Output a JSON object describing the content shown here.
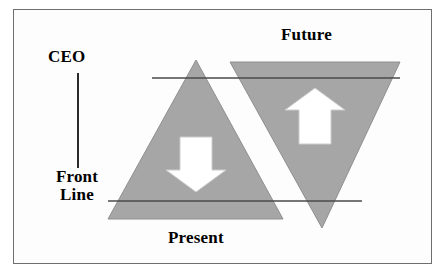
{
  "diagram": {
    "colors": {
      "triangle_fill": "#a6a6a6",
      "triangle_stroke": "#8f8f8f",
      "rule_line": "#4a4a4a",
      "arrow_fill": "#ffffff",
      "arrow_stroke": "#cccccc",
      "frame_border": "#6e6e6e",
      "text": "#000000",
      "background": "#ffffff"
    },
    "labels": {
      "ceo": "CEO",
      "front_line_1": "Front",
      "front_line_2": "Line",
      "future": "Future",
      "present": "Present"
    },
    "shapes": {
      "present_triangle": {
        "name": "upward-triangle",
        "points": "196,60 283,219 108,219"
      },
      "future_triangle": {
        "name": "downward-triangle",
        "points": "230,62 400,62 322,228"
      },
      "upper_rule": {
        "x1": 152,
        "y1": 78,
        "x2": 400,
        "y2": 78
      },
      "lower_rule": {
        "x1": 108,
        "y1": 201,
        "x2": 362,
        "y2": 201
      },
      "axis_line": {
        "x1": 78,
        "y1": 73,
        "x2": 78,
        "y2": 168
      },
      "down_arrow": {
        "name": "down-arrow",
        "points": "180,137 212,137 212,170 226,170 196,192 166,170 180,170"
      },
      "up_arrow": {
        "name": "up-arrow",
        "points": "315,88 345,110 331,110 331,144 299,144 299,110 285,110"
      }
    }
  }
}
